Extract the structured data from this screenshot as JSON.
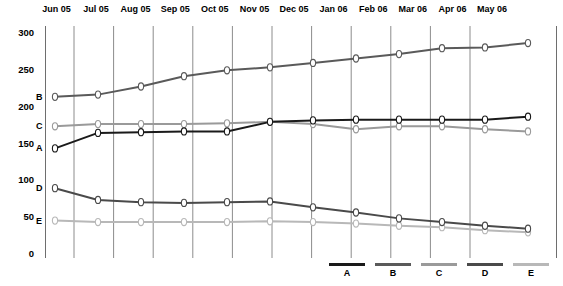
{
  "chart_data": {
    "type": "line",
    "title": "",
    "xlabel": "",
    "ylabel": "",
    "ylim": [
      0,
      300
    ],
    "yticks": [
      0,
      50,
      100,
      150,
      200,
      250,
      300
    ],
    "grid": true,
    "legend_position": "bottom-right",
    "categories": [
      "Jun 05",
      "Jul 05",
      "Aug 05",
      "Sep 05",
      "Oct 05",
      "Nov 05",
      "Dec 05",
      "Jan 06",
      "Feb 06",
      "Mar 06",
      "Apr 06",
      "May 06"
    ],
    "series": [
      {
        "name": "A",
        "color": "#1a1a1a",
        "values": [
          142,
          163,
          164,
          165,
          165,
          178,
          180,
          181,
          181,
          181,
          181,
          185
        ]
      },
      {
        "name": "B",
        "color": "#5a5a5a",
        "values": [
          212,
          215,
          226,
          240,
          248,
          252,
          258,
          264,
          270,
          278,
          279,
          285
        ]
      },
      {
        "name": "C",
        "color": "#9a9a9a",
        "values": [
          172,
          175,
          175,
          175,
          176,
          178,
          175,
          168,
          172,
          172,
          168,
          165
        ]
      },
      {
        "name": "D",
        "color": "#4a4a4a",
        "values": [
          88,
          72,
          69,
          68,
          69,
          70,
          62,
          55,
          47,
          42,
          37,
          33
        ]
      },
      {
        "name": "E",
        "color": "#b8b8b8",
        "values": [
          44,
          42,
          42,
          42,
          42,
          43,
          42,
          40,
          37,
          35,
          31,
          28
        ]
      }
    ]
  },
  "axis": {
    "y_tick_labels": [
      "300",
      "250",
      "200",
      "150",
      "100",
      "50",
      "0"
    ],
    "x_tick_labels": [
      "Jun 05",
      "Jul 05",
      "Aug 05",
      "Sep 05",
      "Oct 05",
      "Nov 05",
      "Dec 05",
      "Jan 06",
      "Feb 06",
      "Mar 06",
      "Apr 06",
      "May 06"
    ]
  },
  "series_labels": [
    {
      "name": "B",
      "value": 212
    },
    {
      "name": "C",
      "value": 172
    },
    {
      "name": "A",
      "value": 142
    },
    {
      "name": "D",
      "value": 88
    },
    {
      "name": "E",
      "value": 44
    }
  ],
  "legend": {
    "items": [
      {
        "label": "A",
        "color": "#1a1a1a"
      },
      {
        "label": "B",
        "color": "#5a5a5a"
      },
      {
        "label": "C",
        "color": "#9a9a9a"
      },
      {
        "label": "D",
        "color": "#4a4a4a"
      },
      {
        "label": "E",
        "color": "#b8b8b8"
      }
    ]
  },
  "colors": {
    "gridline": "#8c8c8c",
    "axis": "#6e6e6e",
    "marker_fill": "#ffffff",
    "background": "#ffffff"
  }
}
